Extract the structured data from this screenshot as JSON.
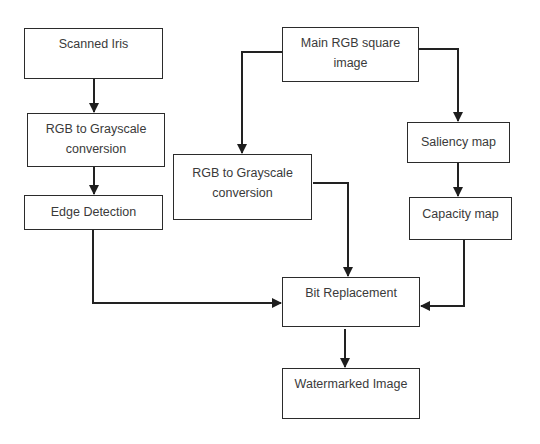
{
  "diagram": {
    "type": "flowchart",
    "line_color": "#222222",
    "nodes": [
      {
        "id": "scanned-iris",
        "label": "Scanned Iris",
        "x": 24,
        "y": 28,
        "w": 139,
        "h": 51
      },
      {
        "id": "rgb-gray-left",
        "label": "RGB to Grayscale conversion",
        "line1": "RGB to Grayscale",
        "line2": "conversion",
        "x": 27,
        "y": 113,
        "w": 138,
        "h": 54
      },
      {
        "id": "edge-detection",
        "label": "Edge Detection",
        "x": 24,
        "y": 195,
        "w": 139,
        "h": 35
      },
      {
        "id": "main-rgb",
        "label": "Main RGB square image",
        "line1": "Main RGB square",
        "line2": "image",
        "x": 282,
        "y": 27,
        "w": 137,
        "h": 55
      },
      {
        "id": "rgb-gray-mid",
        "label": "RGB to Grayscale conversion",
        "line1": "RGB to Grayscale",
        "line2": "conversion",
        "x": 173,
        "y": 154,
        "w": 139,
        "h": 66
      },
      {
        "id": "saliency-map",
        "label": "Saliency map",
        "x": 407,
        "y": 122,
        "w": 103,
        "h": 41
      },
      {
        "id": "capacity-map",
        "label": "Capacity map",
        "x": 409,
        "y": 197,
        "w": 103,
        "h": 43
      },
      {
        "id": "bit-replacement",
        "label": "Bit Replacement",
        "x": 282,
        "y": 277,
        "w": 138,
        "h": 50
      },
      {
        "id": "watermarked-image",
        "label": "Watermarked Image",
        "x": 282,
        "y": 368,
        "w": 138,
        "h": 51
      }
    ],
    "edges": [
      {
        "from": "scanned-iris",
        "to": "rgb-gray-left"
      },
      {
        "from": "rgb-gray-left",
        "to": "edge-detection"
      },
      {
        "from": "edge-detection",
        "to": "bit-replacement"
      },
      {
        "from": "main-rgb",
        "to": "rgb-gray-mid"
      },
      {
        "from": "main-rgb",
        "to": "saliency-map"
      },
      {
        "from": "saliency-map",
        "to": "capacity-map"
      },
      {
        "from": "rgb-gray-mid",
        "to": "bit-replacement"
      },
      {
        "from": "capacity-map",
        "to": "bit-replacement"
      },
      {
        "from": "bit-replacement",
        "to": "watermarked-image"
      }
    ]
  }
}
